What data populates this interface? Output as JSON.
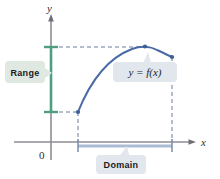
{
  "figure": {
    "background": "#ffffff"
  },
  "axes": {
    "x_label": "x",
    "y_label": "y",
    "origin_label": "0",
    "axis_color": "#8c8c94",
    "x_axis_y": 142,
    "y_axis_x": 51
  },
  "curve": {
    "label": "y = f(x)",
    "color": "#4a6aa5",
    "left_endpoint": {
      "x": 78,
      "y": 112
    },
    "peak": {
      "x": 145,
      "y": 47
    },
    "right_endpoint": {
      "x": 172,
      "y": 57
    }
  },
  "range": {
    "label": "Range",
    "bar_color": "#4f9e82",
    "callout_fill": "#dfe8e1",
    "top_y": 47,
    "bottom_y": 112
  },
  "domain": {
    "label": "Domain",
    "bar_color": "#a9bcd4",
    "callout_fill": "#e2e7ee",
    "left_x": 78,
    "right_x": 172,
    "bar_y": 146
  },
  "guides": {
    "dash_color": "#6a7d9e",
    "style": "dashed"
  }
}
